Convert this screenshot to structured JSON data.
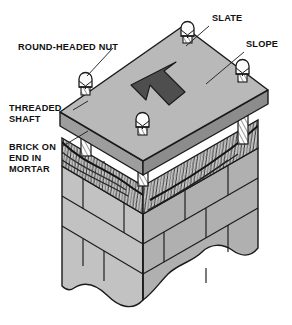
{
  "figure": {
    "background_color": "#ffffff",
    "outline_color": "#1a1a1a"
  },
  "labels": [
    {
      "id": "slate",
      "name": "slate",
      "lines": [
        "SLATE"
      ],
      "x": 212,
      "y": 21
    },
    {
      "id": "slope",
      "name": "slope",
      "lines": [
        "SLOPE"
      ],
      "x": 246,
      "y": 47
    },
    {
      "id": "nut",
      "name": "round-headed-nut",
      "lines": [
        "ROUND-HEADED NUT"
      ],
      "x": 18,
      "y": 50
    },
    {
      "id": "shaft",
      "name": "threaded-shaft",
      "lines": [
        "THREADED",
        "SHAFT"
      ],
      "x": 9,
      "y": 111
    },
    {
      "id": "brick",
      "name": "brick-on-end",
      "lines": [
        "BRICK ON",
        "END IN",
        "MORTAR"
      ],
      "x": 9,
      "y": 150
    }
  ],
  "colors": {
    "slate_top": "#b9b9b9",
    "slate_edge_front": "#9d9d9d",
    "slate_edge_side": "#8c8c8c",
    "brick_face_left": "#c2c2c2",
    "brick_face_right": "#b0b0b0",
    "mortar_band": "#cfcfcf",
    "arrow": "#4e4e4e",
    "shaft": "#fdfdfd",
    "nut": "#fbfbfb",
    "outline": "#1a1a1a"
  },
  "components": {
    "slate_slab": {
      "name": "slate-slab",
      "description": "Sloping slate cap slab"
    },
    "slope_arrow": {
      "name": "slope-direction-arrow",
      "direction": "up-left"
    },
    "nuts": [
      {
        "name": "round-headed-nut-back",
        "x": 187,
        "y": 33
      },
      {
        "name": "round-headed-nut-left",
        "x": 86,
        "y": 83
      },
      {
        "name": "round-headed-nut-right",
        "x": 243,
        "y": 70
      },
      {
        "name": "round-headed-nut-front",
        "x": 143,
        "y": 123
      }
    ],
    "shafts": [
      {
        "name": "threaded-shaft-left",
        "x": 86
      },
      {
        "name": "threaded-shaft-right",
        "x": 243
      },
      {
        "name": "threaded-shaft-front",
        "x": 143
      }
    ],
    "brick_on_end_course": {
      "name": "brick-on-end-course",
      "description": "Textured wavy course of bricks laid on end in mortar"
    },
    "brick_pier": {
      "name": "brick-pier",
      "description": "Coursed brick pier with staggered joints and wavy break line at base"
    }
  }
}
